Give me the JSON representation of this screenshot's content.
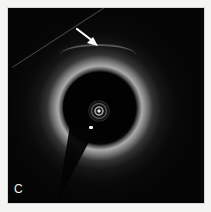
{
  "figure": {
    "panel_label": "C",
    "annotations": [
      {
        "type": "arrow",
        "color": "#ffffff",
        "points_to": "fibrous-cap-region"
      }
    ],
    "colors": {
      "background": "#f4f4f2",
      "panel": "#050505",
      "vessel_wall": "#c8c8c8",
      "label": "#f2f2f2"
    }
  }
}
